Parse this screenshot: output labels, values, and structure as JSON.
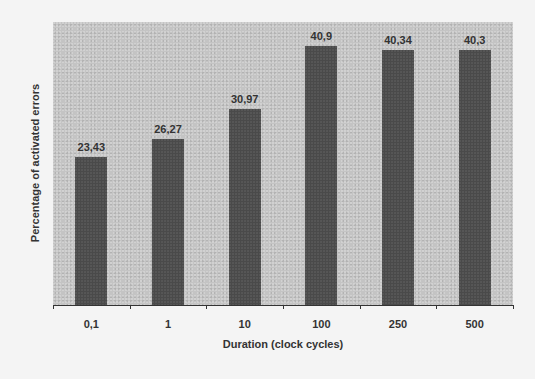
{
  "chart_data": {
    "type": "bar",
    "title": "",
    "xlabel": "Duration (clock cycles)",
    "ylabel": "Percentage of activated errors",
    "categories": [
      "0,1",
      "1",
      "10",
      "100",
      "250",
      "500"
    ],
    "values": [
      23.43,
      26.27,
      30.97,
      40.9,
      40.34,
      40.3
    ],
    "value_labels": [
      "23,43",
      "26,27",
      "30,97",
      "40,9",
      "40,34",
      "40,3"
    ],
    "ylim": [
      0,
      44.7
    ],
    "grid": false,
    "legend": null,
    "colors": {
      "bar": "#4a4a4a",
      "plot_background": "#c4c4c4",
      "page_background": "#f4f4f4"
    }
  }
}
